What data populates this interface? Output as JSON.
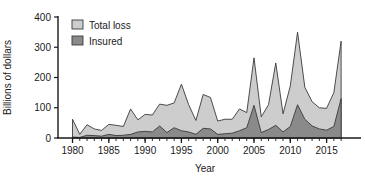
{
  "chart_data": {
    "type": "area",
    "title": "",
    "xlabel": "Year",
    "ylabel": "Billions of dollars",
    "xlim": [
      1978,
      2018.5
    ],
    "ylim": [
      0,
      400
    ],
    "grid": false,
    "legend_position": "top-left",
    "x_ticks": [
      "1980",
      "1985",
      "1990",
      "1995",
      "2000",
      "2005",
      "2010",
      "2015"
    ],
    "x_tick_values": [
      1980,
      1985,
      1990,
      1995,
      2000,
      2005,
      2010,
      2015
    ],
    "y_ticks": [
      "0",
      "100",
      "200",
      "300",
      "400"
    ],
    "y_tick_values": [
      0,
      100,
      200,
      300,
      400
    ],
    "x": [
      1980,
      1981,
      1982,
      1983,
      1984,
      1985,
      1986,
      1987,
      1988,
      1989,
      1990,
      1991,
      1992,
      1993,
      1994,
      1995,
      1996,
      1997,
      1998,
      1999,
      2000,
      2001,
      2002,
      2003,
      2004,
      2005,
      2006,
      2007,
      2008,
      2009,
      2010,
      2011,
      2012,
      2013,
      2014,
      2015,
      2016,
      2017
    ],
    "series": [
      {
        "name": "Total loss",
        "color": "#cdcdcd",
        "values": [
          62,
          12,
          44,
          30,
          25,
          45,
          42,
          38,
          96,
          60,
          78,
          76,
          112,
          108,
          116,
          178,
          110,
          58,
          144,
          134,
          56,
          62,
          62,
          96,
          84,
          265,
          70,
          110,
          248,
          80,
          172,
          350,
          168,
          120,
          100,
          98,
          150,
          320
        ]
      },
      {
        "name": "Insured",
        "color": "#8a8a8a",
        "values": [
          3,
          2,
          9,
          8,
          6,
          12,
          8,
          9,
          12,
          20,
          22,
          20,
          40,
          18,
          34,
          24,
          20,
          12,
          32,
          30,
          12,
          14,
          16,
          24,
          34,
          108,
          18,
          28,
          42,
          20,
          38,
          110,
          62,
          40,
          30,
          26,
          38,
          130
        ]
      }
    ],
    "legend": [
      {
        "label": "Total loss",
        "color": "#cdcdcd"
      },
      {
        "label": "Insured",
        "color": "#8a8a8a"
      }
    ]
  },
  "axes": {
    "y_label": "Billions of dollars",
    "x_label": "Year"
  }
}
